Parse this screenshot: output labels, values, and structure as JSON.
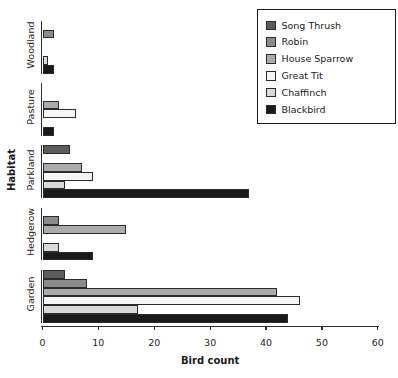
{
  "chart_data": {
    "type": "bar",
    "orientation": "horizontal",
    "title": "",
    "xlabel": "Bird count",
    "ylabel": "Habitat",
    "xlim": [
      0,
      60
    ],
    "xticks": [
      0,
      10,
      20,
      30,
      40,
      50,
      60
    ],
    "grid": false,
    "categories": [
      "Woodland",
      "Pasture",
      "Parkland",
      "Hedgerow",
      "Garden"
    ],
    "series": [
      {
        "name": "Song Thrush",
        "color": "#5c5c5c",
        "values": [
          0,
          0,
          5,
          0,
          4
        ]
      },
      {
        "name": "Robin",
        "color": "#8a8a8a",
        "values": [
          2,
          0,
          0,
          3,
          8
        ]
      },
      {
        "name": "House Sparrow",
        "color": "#ababab",
        "values": [
          0,
          3,
          7,
          15,
          42
        ]
      },
      {
        "name": "Great Tit",
        "color": "#f5f5f5",
        "values": [
          0,
          6,
          9,
          0,
          46
        ]
      },
      {
        "name": "Chaffinch",
        "color": "#d9d9d9",
        "values": [
          1,
          0,
          4,
          3,
          17
        ]
      },
      {
        "name": "Blackbird",
        "color": "#1a1a1a",
        "values": [
          2,
          2,
          37,
          9,
          44
        ]
      }
    ],
    "legend": {
      "position": "upper right"
    },
    "bar_edge_color": "#2b2b2b"
  }
}
